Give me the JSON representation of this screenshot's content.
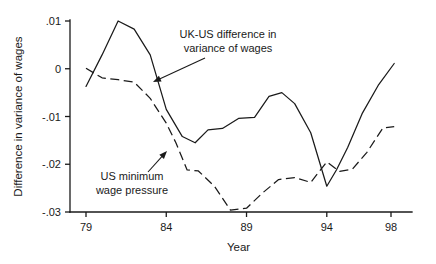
{
  "chart_data": {
    "type": "line",
    "title": "",
    "xlabel": "Year",
    "ylabel": "Difference in variance of wages",
    "xlim": [
      79,
      99
    ],
    "ylim": [
      -0.032,
      0.012
    ],
    "xticks": [
      79,
      84,
      89,
      94,
      98
    ],
    "xtick_labels": [
      "79",
      "84",
      "89",
      "94",
      "98"
    ],
    "yticks": [
      0.01,
      0,
      -0.01,
      -0.02,
      -0.03
    ],
    "ytick_labels": [
      ".01",
      "0",
      "-.01",
      "-.02",
      "-.03"
    ],
    "grid": false,
    "legend": "annotations",
    "series": [
      {
        "name": "UK-US difference in variance of wages",
        "style": "solid",
        "x": [
          79,
          80,
          81,
          82,
          83,
          84,
          85,
          85.8,
          86.6,
          87.5,
          88.5,
          89.5,
          90.4,
          91.2,
          92,
          93,
          94,
          94.6,
          95.3,
          96.2,
          97.2,
          98.2
        ],
        "y": [
          -0.0037,
          0.0029,
          0.01,
          0.0083,
          0.0029,
          -0.0085,
          -0.0142,
          -0.0155,
          -0.0128,
          -0.0125,
          -0.0104,
          -0.0102,
          -0.0058,
          -0.005,
          -0.0073,
          -0.0134,
          -0.0246,
          -0.0212,
          -0.0165,
          -0.0094,
          -0.0035,
          0.0011
        ]
      },
      {
        "name": "US minimum wage pressure",
        "style": "dashed",
        "x": [
          79,
          80,
          81,
          82,
          83,
          84,
          84.6,
          85.3,
          86,
          87,
          88,
          89,
          90,
          91,
          92,
          93,
          94,
          94.8,
          95.6,
          96.5,
          97.5,
          98.2
        ],
        "y": [
          0.0001,
          -0.0019,
          -0.0023,
          -0.0028,
          -0.0062,
          -0.0114,
          -0.0155,
          -0.0212,
          -0.0214,
          -0.0246,
          -0.0296,
          -0.0292,
          -0.026,
          -0.0232,
          -0.0228,
          -0.0238,
          -0.0195,
          -0.0215,
          -0.021,
          -0.0175,
          -0.0124,
          -0.0121
        ]
      }
    ],
    "annotations": [
      {
        "id": "uk-us-annotation",
        "lines": [
          "UK-US difference in",
          "variance of wages"
        ],
        "text_x": 228,
        "text_y": 38,
        "arrow_from_x": 205,
        "arrow_from_y": 58,
        "arrow_to_x": 153,
        "arrow_to_y": 82
      },
      {
        "id": "us-min-wage-annotation",
        "lines": [
          "US minimum",
          "wage pressure"
        ],
        "text_x": 132,
        "text_y": 180,
        "arrow_from_x": 148,
        "arrow_from_y": 172,
        "arrow_to_x": 167,
        "arrow_to_y": 151
      }
    ],
    "colors": {
      "ink": "#1a1a1a",
      "background": "#ffffff"
    }
  }
}
